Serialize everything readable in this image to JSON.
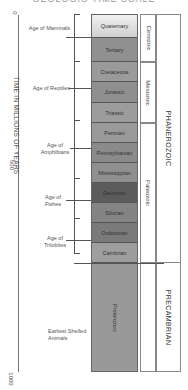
{
  "title": "GEOLOGIC TIME SCALE",
  "axis": {
    "title": "TIME IN MILLIONS OF YEARS",
    "ticks": [
      {
        "label": "0",
        "y": 15
      },
      {
        "label": "500",
        "y": 165
      },
      {
        "label": "1000",
        "y": 372
      }
    ]
  },
  "periods": [
    {
      "name": "Quaternary",
      "top": 14,
      "height": 24,
      "color": "#e2e2e2"
    },
    {
      "name": "Tertiary",
      "top": 38,
      "height": 24,
      "color": "#909090"
    },
    {
      "name": "Cretaceous",
      "top": 62,
      "height": 20,
      "color": "#9a9a9a"
    },
    {
      "name": "Jurassic",
      "top": 82,
      "height": 21,
      "color": "#8f8f8f"
    },
    {
      "name": "Triassic",
      "top": 103,
      "height": 20,
      "color": "#9c9c9c"
    },
    {
      "name": "Permian",
      "top": 123,
      "height": 20,
      "color": "#9a9a9a"
    },
    {
      "name": "Pennsylvanian",
      "top": 143,
      "height": 20,
      "color": "#8a8a8a"
    },
    {
      "name": "Mississippian",
      "top": 163,
      "height": 20,
      "color": "#8f8f8f"
    },
    {
      "name": "Devonian",
      "top": 183,
      "height": 20,
      "color": "#5c5c5c"
    },
    {
      "name": "Silurian",
      "top": 203,
      "height": 20,
      "color": "#848484"
    },
    {
      "name": "Ordovician",
      "top": 223,
      "height": 20,
      "color": "#7a7a7a"
    },
    {
      "name": "Cambrian",
      "top": 243,
      "height": 20,
      "color": "#9e9e9e"
    },
    {
      "name": "Proterozoic",
      "top": 263,
      "height": 109,
      "color": "#999999"
    }
  ],
  "eras": [
    {
      "name": "Cenozoic",
      "top": 14,
      "height": 48
    },
    {
      "name": "Mesozoic",
      "top": 62,
      "height": 61
    },
    {
      "name": "Paleozoic",
      "top": 123,
      "height": 140
    }
  ],
  "eons": [
    {
      "name": "PHANEROZOIC",
      "top": 14,
      "height": 249
    },
    {
      "name": "PRECAMBRIAN",
      "top": 263,
      "height": 109
    }
  ],
  "ages": [
    {
      "label": "Age of Mammals",
      "line_y": 37
    },
    {
      "label": "Age of Reptiles",
      "line_y": 88
    },
    {
      "label": "Age of Amphibians",
      "line_y": 148
    },
    {
      "label": "Age of Fishes",
      "line_y": 200
    },
    {
      "label": "Age of Trilobites",
      "line_y": 240
    },
    {
      "label": "Earliest Shelled Animals",
      "line_y": null
    }
  ]
}
